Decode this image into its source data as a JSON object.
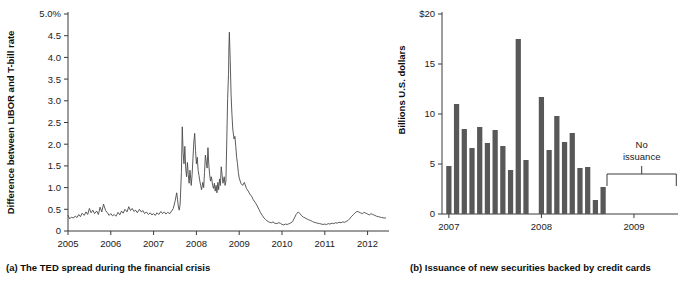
{
  "figure": {
    "panel_a": {
      "caption": "(a) The TED spread during the financial crisis",
      "ylabel": "Difference between LIBOR and T-bill rate",
      "ytick_labels": [
        "0",
        "0.5",
        "1.0",
        "1.5",
        "2.0",
        "2.5",
        "3.0",
        "3.5",
        "4.0",
        "4.5",
        "5.0%"
      ],
      "xtick_labels": [
        "2005",
        "2006",
        "2007",
        "2008",
        "2009",
        "2010",
        "2011",
        "2012"
      ]
    },
    "panel_b": {
      "caption": "(b) Issuance of new securities backed by credit cards",
      "ylabel": "Billions U.S. dollars",
      "ytick_labels": [
        "0",
        "5",
        "10",
        "15",
        "$20"
      ],
      "xtick_labels": [
        "2007",
        "2008",
        "2009"
      ],
      "annotation_line1": "No",
      "annotation_line2": "issuance"
    }
  },
  "colors": {
    "bar_fill": "#585858",
    "line_stroke": "#4a4a4a",
    "axis": "#3a3a3a",
    "text": "#1a1a1a",
    "background": "#ffffff"
  },
  "chart_data": [
    {
      "id": "panel_a",
      "type": "line",
      "title": "(a) The TED spread during the financial crisis",
      "xlabel": "",
      "ylabel": "Difference between LIBOR and T-bill rate",
      "xlim": [
        2005.0,
        2012.5
      ],
      "ylim": [
        0,
        5.0
      ],
      "yticks": [
        0,
        0.5,
        1.0,
        1.5,
        2.0,
        2.5,
        3.0,
        3.5,
        4.0,
        4.5,
        5.0
      ],
      "ytick_labels": [
        "0",
        "0.5",
        "1.0",
        "1.5",
        "2.0",
        "2.5",
        "3.0",
        "3.5",
        "4.0",
        "4.5",
        "5.0%"
      ],
      "xticks": [
        2005,
        2006,
        2007,
        2008,
        2009,
        2010,
        2011,
        2012
      ],
      "xtick_labels": [
        "2005",
        "2006",
        "2007",
        "2008",
        "2009",
        "2010",
        "2011",
        "2012"
      ],
      "grid": false,
      "legend": "none",
      "units": "percentage points",
      "series": [
        {
          "name": "TED spread",
          "x": [
            2005.0,
            2005.04,
            2005.08,
            2005.12,
            2005.17,
            2005.21,
            2005.25,
            2005.29,
            2005.33,
            2005.38,
            2005.42,
            2005.46,
            2005.5,
            2005.54,
            2005.58,
            2005.62,
            2005.67,
            2005.71,
            2005.75,
            2005.79,
            2005.83,
            2005.88,
            2005.92,
            2005.96,
            2006.0,
            2006.04,
            2006.08,
            2006.12,
            2006.17,
            2006.21,
            2006.25,
            2006.29,
            2006.33,
            2006.38,
            2006.42,
            2006.46,
            2006.5,
            2006.54,
            2006.58,
            2006.62,
            2006.67,
            2006.71,
            2006.75,
            2006.79,
            2006.83,
            2006.88,
            2006.92,
            2006.96,
            2007.0,
            2007.04,
            2007.08,
            2007.12,
            2007.17,
            2007.21,
            2007.25,
            2007.29,
            2007.33,
            2007.38,
            2007.42,
            2007.46,
            2007.5,
            2007.54,
            2007.56,
            2007.58,
            2007.6,
            2007.62,
            2007.65,
            2007.67,
            2007.69,
            2007.71,
            2007.73,
            2007.75,
            2007.77,
            2007.79,
            2007.81,
            2007.83,
            2007.85,
            2007.88,
            2007.9,
            2007.92,
            2007.94,
            2007.96,
            2007.98,
            2008.0,
            2008.02,
            2008.04,
            2008.06,
            2008.08,
            2008.1,
            2008.12,
            2008.15,
            2008.17,
            2008.19,
            2008.21,
            2008.23,
            2008.25,
            2008.27,
            2008.29,
            2008.31,
            2008.33,
            2008.35,
            2008.38,
            2008.4,
            2008.42,
            2008.44,
            2008.46,
            2008.48,
            2008.5,
            2008.52,
            2008.54,
            2008.56,
            2008.58,
            2008.6,
            2008.62,
            2008.65,
            2008.67,
            2008.69,
            2008.71,
            2008.73,
            2008.75,
            2008.76,
            2008.77,
            2008.79,
            2008.81,
            2008.83,
            2008.85,
            2008.88,
            2008.9,
            2008.92,
            2008.94,
            2008.96,
            2008.98,
            2009.0,
            2009.04,
            2009.08,
            2009.12,
            2009.17,
            2009.21,
            2009.25,
            2009.29,
            2009.33,
            2009.38,
            2009.42,
            2009.46,
            2009.5,
            2009.54,
            2009.58,
            2009.62,
            2009.67,
            2009.71,
            2009.75,
            2009.79,
            2009.83,
            2009.88,
            2009.92,
            2009.96,
            2010.0,
            2010.04,
            2010.08,
            2010.12,
            2010.17,
            2010.21,
            2010.25,
            2010.29,
            2010.33,
            2010.38,
            2010.42,
            2010.46,
            2010.5,
            2010.54,
            2010.58,
            2010.62,
            2010.67,
            2010.71,
            2010.75,
            2010.79,
            2010.83,
            2010.88,
            2010.92,
            2010.96,
            2011.0,
            2011.04,
            2011.08,
            2011.12,
            2011.17,
            2011.21,
            2011.25,
            2011.29,
            2011.33,
            2011.38,
            2011.42,
            2011.46,
            2011.5,
            2011.54,
            2011.58,
            2011.62,
            2011.67,
            2011.71,
            2011.75,
            2011.79,
            2011.83,
            2011.88,
            2011.92,
            2011.96,
            2012.0,
            2012.04,
            2012.08,
            2012.12,
            2012.17,
            2012.21,
            2012.25,
            2012.29,
            2012.33,
            2012.38,
            2012.42
          ],
          "y": [
            0.36,
            0.28,
            0.32,
            0.3,
            0.34,
            0.31,
            0.38,
            0.33,
            0.41,
            0.36,
            0.44,
            0.38,
            0.52,
            0.42,
            0.48,
            0.4,
            0.46,
            0.38,
            0.55,
            0.44,
            0.62,
            0.47,
            0.42,
            0.36,
            0.4,
            0.35,
            0.38,
            0.34,
            0.43,
            0.37,
            0.46,
            0.41,
            0.5,
            0.44,
            0.56,
            0.47,
            0.52,
            0.45,
            0.48,
            0.42,
            0.5,
            0.44,
            0.47,
            0.4,
            0.44,
            0.38,
            0.42,
            0.37,
            0.4,
            0.36,
            0.42,
            0.38,
            0.45,
            0.4,
            0.44,
            0.39,
            0.43,
            0.4,
            0.46,
            0.52,
            0.68,
            0.88,
            0.72,
            0.55,
            0.48,
            0.62,
            1.35,
            2.4,
            1.8,
            1.55,
            1.95,
            1.45,
            1.25,
            1.58,
            1.3,
            1.1,
            1.4,
            1.05,
            1.3,
            1.68,
            2.05,
            2.25,
            1.85,
            1.55,
            1.7,
            1.4,
            1.28,
            1.15,
            1.05,
            0.95,
            1.12,
            1.0,
            1.35,
            1.75,
            1.6,
            1.45,
            1.92,
            1.52,
            1.3,
            1.15,
            1.25,
            1.05,
            0.98,
            1.1,
            0.92,
            1.05,
            0.88,
            1.12,
            0.95,
            1.2,
            1.05,
            1.48,
            1.3,
            1.1,
            1.25,
            1.05,
            1.15,
            2.1,
            3.05,
            3.6,
            4.25,
            4.58,
            3.95,
            3.15,
            2.7,
            2.35,
            2.12,
            2.18,
            1.95,
            1.7,
            1.55,
            1.35,
            1.22,
            1.1,
            1.05,
            1.12,
            0.98,
            0.92,
            0.85,
            0.8,
            0.72,
            0.65,
            0.58,
            0.5,
            0.42,
            0.36,
            0.3,
            0.26,
            0.22,
            0.2,
            0.19,
            0.21,
            0.18,
            0.17,
            0.19,
            0.18,
            0.15,
            0.14,
            0.16,
            0.15,
            0.17,
            0.19,
            0.22,
            0.3,
            0.38,
            0.44,
            0.4,
            0.35,
            0.32,
            0.3,
            0.28,
            0.26,
            0.24,
            0.22,
            0.2,
            0.19,
            0.18,
            0.17,
            0.16,
            0.15,
            0.16,
            0.15,
            0.17,
            0.16,
            0.18,
            0.17,
            0.19,
            0.18,
            0.2,
            0.19,
            0.21,
            0.2,
            0.22,
            0.24,
            0.28,
            0.33,
            0.38,
            0.42,
            0.45,
            0.44,
            0.42,
            0.4,
            0.43,
            0.41,
            0.39,
            0.37,
            0.4,
            0.38,
            0.36,
            0.34,
            0.33,
            0.32,
            0.31,
            0.3,
            0.3
          ]
        }
      ]
    },
    {
      "id": "panel_b",
      "type": "bar",
      "title": "(b) Issuance of new securities backed by credit cards",
      "xlabel": "",
      "ylabel": "Billions U.S. dollars",
      "ylim": [
        0,
        20
      ],
      "yticks": [
        0,
        5,
        10,
        15,
        20
      ],
      "ytick_labels": [
        "0",
        "5",
        "10",
        "15",
        "$20"
      ],
      "xticks": [
        "2007",
        "2008",
        "2009"
      ],
      "xtick_labels": [
        "2007",
        "2008",
        "2009"
      ],
      "grid": false,
      "legend": "none",
      "units": "billions of U.S. dollars",
      "annotations": [
        {
          "text": "No issuance",
          "lines": [
            "No",
            "issuance"
          ],
          "from": "2008-09",
          "to": "2009-06"
        }
      ],
      "categories": [
        "2007-01",
        "2007-02",
        "2007-03",
        "2007-04",
        "2007-05",
        "2007-06",
        "2007-07",
        "2007-08",
        "2007-09",
        "2007-10",
        "2007-11",
        "2007-12",
        "2008-01",
        "2008-02",
        "2008-03",
        "2008-04",
        "2008-05",
        "2008-06",
        "2008-07",
        "2008-08",
        "2008-09",
        "2008-10",
        "2008-11",
        "2008-12",
        "2009-01",
        "2009-02",
        "2009-03",
        "2009-04",
        "2009-05",
        "2009-06"
      ],
      "values": [
        4.8,
        11.0,
        8.5,
        6.6,
        8.7,
        7.1,
        8.4,
        6.8,
        4.4,
        17.5,
        5.4,
        0.0,
        11.7,
        6.4,
        9.8,
        7.2,
        8.1,
        4.6,
        4.7,
        1.4,
        2.7,
        0.0,
        0.0,
        0.0,
        0.0,
        0.0,
        0.0,
        0.0,
        0.0,
        0.0
      ]
    }
  ]
}
